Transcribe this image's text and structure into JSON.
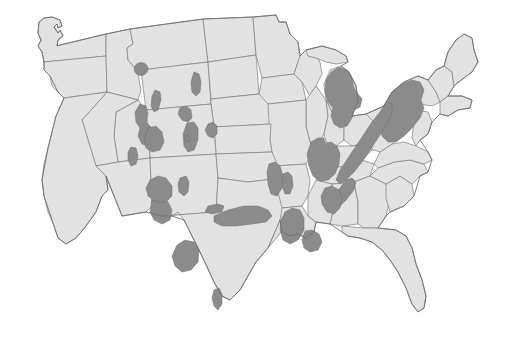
{
  "figure": {
    "type": "map",
    "title": "",
    "subtitle": "",
    "caption": "",
    "legend": null,
    "has_text_labels": false,
    "background_color": "#ffffff",
    "land_fill_color": "#e2e2e2",
    "border_stroke_color": "#7d7d7d",
    "range_fill_color": "#8b8b8b",
    "range_stroke_color": "#6e6e6e",
    "projection_hint": "albers-usa-like",
    "width_px": 508,
    "height_px": 349
  },
  "map_data": {
    "type": "choropleth-range",
    "description": "Contiguous United States base map with shaded distribution patches",
    "base_layer": {
      "name": "state-boundaries",
      "unit_count": 48,
      "fill": "#e2e2e2",
      "stroke": "#7d7d7d"
    },
    "range_layer": {
      "name": "shaded-distribution-areas",
      "fill": "#8b8b8b",
      "patch_count": 27,
      "regions": [
        {
          "id": "montana-central-circle",
          "label": "Central Montana",
          "size": "small",
          "shape": "circular"
        },
        {
          "id": "dakota-elongate",
          "label": "Western Dakotas",
          "size": "small",
          "shape": "elongate"
        },
        {
          "id": "wyoming-north",
          "label": "Northern Wyoming",
          "size": "small",
          "shape": "elongate"
        },
        {
          "id": "idaho-wyoming-band",
          "label": "Idaho / Western Wyoming",
          "size": "medium",
          "shape": "irregular-band"
        },
        {
          "id": "idaho-south-blob",
          "label": "Southern Idaho",
          "size": "medium",
          "shape": "lobed"
        },
        {
          "id": "utah-wasatch",
          "label": "Utah Wasatch",
          "size": "small",
          "shape": "elongate"
        },
        {
          "id": "colorado-west",
          "label": "Western Colorado",
          "size": "small",
          "shape": "blob"
        },
        {
          "id": "colorado-front-range",
          "label": "Colorado Front Range",
          "size": "medium",
          "shape": "elongate"
        },
        {
          "id": "nebraska-panhandle",
          "label": "Nebraska Panhandle",
          "size": "small",
          "shape": "blob"
        },
        {
          "id": "black-hills",
          "label": "Black Hills",
          "size": "small",
          "shape": "blob"
        },
        {
          "id": "utah-southeast-dot",
          "label": "Southeast Utah",
          "size": "tiny",
          "shape": "square-dot"
        },
        {
          "id": "newmexico-north",
          "label": "Northern New Mexico",
          "size": "medium",
          "shape": "blob"
        },
        {
          "id": "newmexico-east",
          "label": "Eastern New Mexico",
          "size": "small",
          "shape": "elongate"
        },
        {
          "id": "texas-west",
          "label": "West Texas",
          "size": "medium",
          "shape": "lobed"
        },
        {
          "id": "texas-south",
          "label": "South Texas",
          "size": "small",
          "shape": "elongate"
        },
        {
          "id": "kansas-south",
          "label": "Southern Kansas",
          "size": "small",
          "shape": "lens"
        },
        {
          "id": "oklahoma-band",
          "label": "Oklahoma Band",
          "size": "medium",
          "shape": "elongate"
        },
        {
          "id": "ozark-missouri",
          "label": "Missouri Ozarks",
          "size": "medium",
          "shape": "blob"
        },
        {
          "id": "arkansas-ouachita",
          "label": "Arkansas Ouachita",
          "size": "medium",
          "shape": "lobed"
        },
        {
          "id": "missouri-north",
          "label": "Northern Missouri",
          "size": "small",
          "shape": "elongate"
        },
        {
          "id": "illinois-east",
          "label": "Eastern Illinois",
          "size": "small",
          "shape": "elongate"
        },
        {
          "id": "illinois-indiana",
          "label": "Illinois / Indiana",
          "size": "large",
          "shape": "blob"
        },
        {
          "id": "michigan-lower",
          "label": "Michigan Lower Peninsula",
          "size": "large",
          "shape": "peninsula"
        },
        {
          "id": "appalachian-north",
          "label": "New York / Pennsylvania",
          "size": "large",
          "shape": "broad-band"
        },
        {
          "id": "appalachian-central",
          "label": "West Virginia / Virginia",
          "size": "large",
          "shape": "diagonal-band"
        },
        {
          "id": "appalachian-south",
          "label": "Tennessee / Carolinas",
          "size": "medium",
          "shape": "diagonal-band"
        },
        {
          "id": "alabama-north",
          "label": "Northern Alabama",
          "size": "medium",
          "shape": "blob"
        }
      ]
    },
    "unshaded_notes": [
      "Pacific Northwest (Washington, Oregon) unshaded",
      "California unshaded",
      "Nevada and Arizona largely unshaded",
      "Florida unshaded",
      "Maine and most of New England unshaded",
      "Deep South coastal plain unshaded"
    ]
  }
}
